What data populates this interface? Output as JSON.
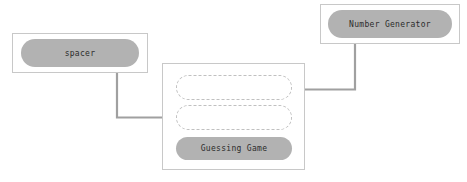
{
  "diagram": {
    "canvas": {
      "width": 467,
      "height": 182,
      "background": "#ffffff"
    },
    "colors": {
      "pill_fill": "#b2b2b2",
      "box_border": "#c8c8c8",
      "slot_border": "#c0c0c0",
      "edge": "#a0a0a0",
      "text": "#2b2b2b"
    },
    "nodes": [
      {
        "id": "spacer",
        "label": "spacer",
        "kind": "component-box"
      },
      {
        "id": "number-generator",
        "label": "Number Generator",
        "kind": "component-box"
      },
      {
        "id": "guessing-game",
        "label": "Guessing Game",
        "kind": "component-box-with-slots",
        "slots": [
          {
            "id": "slot-top",
            "label": ""
          },
          {
            "id": "slot-bottom",
            "label": ""
          }
        ]
      }
    ],
    "edges": [
      {
        "id": "edge-spacer-to-guessing",
        "from": "spacer",
        "to": "slot-bottom",
        "arrow": "right"
      },
      {
        "id": "edge-numgen-to-guessing",
        "from": "number-generator",
        "to": "slot-top",
        "arrow": "left"
      }
    ]
  }
}
